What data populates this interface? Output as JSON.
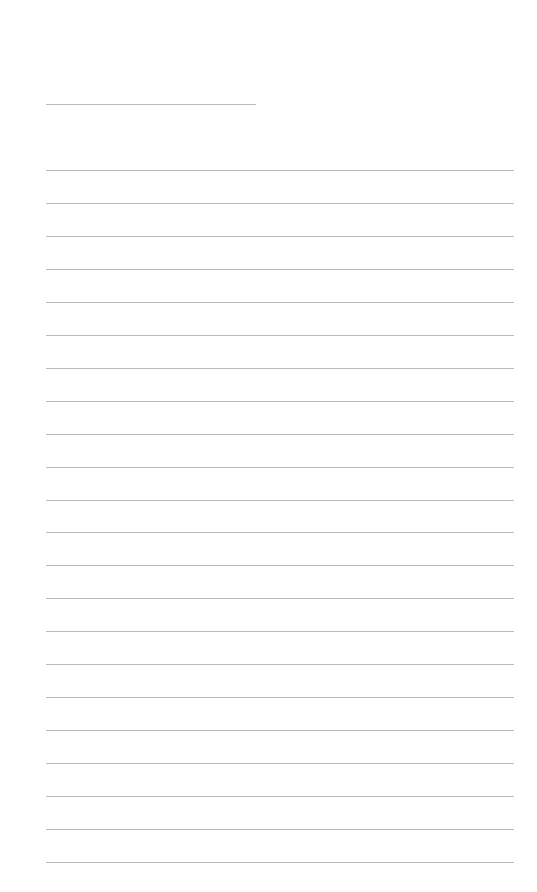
{
  "page": {
    "type": "lined-paper",
    "background_color": "#ffffff",
    "line_color": "#b8b8b8"
  },
  "title_line": {
    "text": ""
  },
  "lines": [
    {
      "text": ""
    },
    {
      "text": ""
    },
    {
      "text": ""
    },
    {
      "text": ""
    },
    {
      "text": ""
    },
    {
      "text": ""
    },
    {
      "text": ""
    },
    {
      "text": ""
    },
    {
      "text": ""
    },
    {
      "text": ""
    },
    {
      "text": ""
    },
    {
      "text": ""
    },
    {
      "text": ""
    },
    {
      "text": ""
    },
    {
      "text": ""
    },
    {
      "text": ""
    },
    {
      "text": ""
    },
    {
      "text": ""
    },
    {
      "text": ""
    },
    {
      "text": ""
    },
    {
      "text": ""
    },
    {
      "text": ""
    }
  ]
}
